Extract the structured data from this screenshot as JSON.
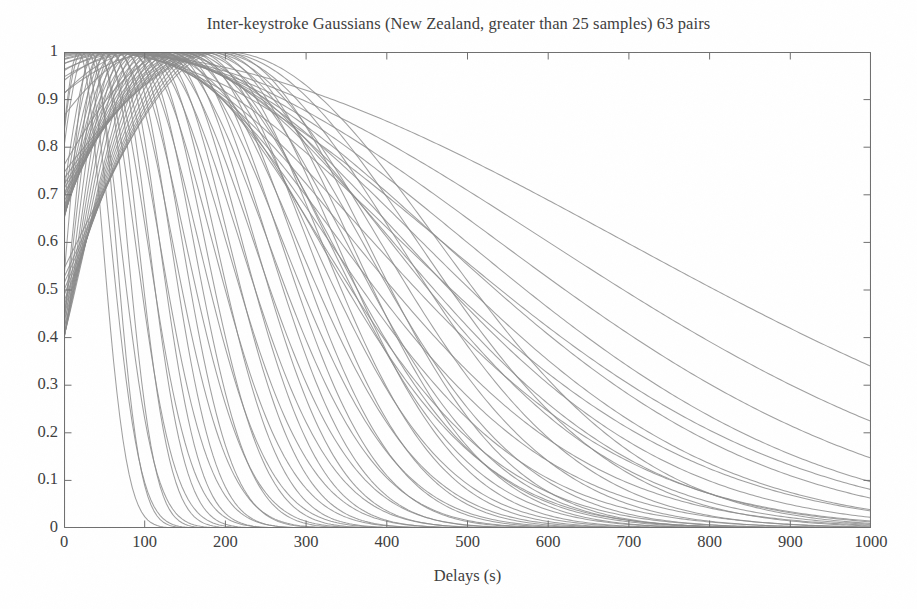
{
  "chart_data": {
    "type": "line",
    "title": "Inter-keystroke Gaussians (New Zealand, greater than 25 samples) 63 pairs",
    "xlabel": "Delays (s)",
    "ylabel": "",
    "xlim": [
      0,
      1000
    ],
    "ylim": [
      0,
      1
    ],
    "grid": false,
    "legend_position": "none",
    "series_count": 63,
    "curve_color": "#8a8a8a",
    "axis_color": "#6f6f6f",
    "background_color": "#ffffff",
    "text_color": "#3d3d3d",
    "x_ticks": [
      0,
      100,
      200,
      300,
      400,
      500,
      600,
      700,
      800,
      900,
      1000
    ],
    "y_ticks": [
      0,
      0.1,
      0.2,
      0.3,
      0.4,
      0.5,
      0.6,
      0.7,
      0.8,
      0.9,
      1
    ],
    "x_tick_labels": [
      "0",
      "100",
      "200",
      "300",
      "400",
      "500",
      "600",
      "700",
      "800",
      "900",
      "1000"
    ],
    "y_tick_labels": [
      "0",
      "0.1",
      "0.2",
      "0.3",
      "0.4",
      "0.5",
      "0.6",
      "0.7",
      "0.8",
      "0.9",
      "1"
    ],
    "series": [
      {
        "name": "pair-1",
        "mu": 18,
        "sigma": 30
      },
      {
        "name": "pair-2",
        "mu": 22,
        "sigma": 36
      },
      {
        "name": "pair-3",
        "mu": 28,
        "sigma": 42
      },
      {
        "name": "pair-4",
        "mu": 34,
        "sigma": 30
      },
      {
        "name": "pair-5",
        "mu": 40,
        "sigma": 48
      },
      {
        "name": "pair-6",
        "mu": 44,
        "sigma": 34
      },
      {
        "name": "pair-7",
        "mu": 48,
        "sigma": 55
      },
      {
        "name": "pair-8",
        "mu": 52,
        "sigma": 40
      },
      {
        "name": "pair-9",
        "mu": 56,
        "sigma": 62
      },
      {
        "name": "pair-10",
        "mu": 60,
        "sigma": 45
      },
      {
        "name": "pair-11",
        "mu": 64,
        "sigma": 70
      },
      {
        "name": "pair-12",
        "mu": 68,
        "sigma": 50
      },
      {
        "name": "pair-13",
        "mu": 72,
        "sigma": 78
      },
      {
        "name": "pair-14",
        "mu": 76,
        "sigma": 56
      },
      {
        "name": "pair-15",
        "mu": 80,
        "sigma": 86
      },
      {
        "name": "pair-16",
        "mu": 84,
        "sigma": 62
      },
      {
        "name": "pair-17",
        "mu": 88,
        "sigma": 95
      },
      {
        "name": "pair-18",
        "mu": 92,
        "sigma": 68
      },
      {
        "name": "pair-19",
        "mu": 96,
        "sigma": 104
      },
      {
        "name": "pair-20",
        "mu": 100,
        "sigma": 74
      },
      {
        "name": "pair-21",
        "mu": 104,
        "sigma": 113
      },
      {
        "name": "pair-22",
        "mu": 108,
        "sigma": 80
      },
      {
        "name": "pair-23",
        "mu": 112,
        "sigma": 122
      },
      {
        "name": "pair-24",
        "mu": 116,
        "sigma": 88
      },
      {
        "name": "pair-25",
        "mu": 120,
        "sigma": 132
      },
      {
        "name": "pair-26",
        "mu": 124,
        "sigma": 96
      },
      {
        "name": "pair-27",
        "mu": 128,
        "sigma": 142
      },
      {
        "name": "pair-28",
        "mu": 132,
        "sigma": 104
      },
      {
        "name": "pair-29",
        "mu": 136,
        "sigma": 152
      },
      {
        "name": "pair-30",
        "mu": 140,
        "sigma": 112
      },
      {
        "name": "pair-31",
        "mu": 144,
        "sigma": 163
      },
      {
        "name": "pair-32",
        "mu": 148,
        "sigma": 120
      },
      {
        "name": "pair-33",
        "mu": 152,
        "sigma": 175
      },
      {
        "name": "pair-34",
        "mu": 156,
        "sigma": 128
      },
      {
        "name": "pair-35",
        "mu": 160,
        "sigma": 188
      },
      {
        "name": "pair-36",
        "mu": 164,
        "sigma": 137
      },
      {
        "name": "pair-37",
        "mu": 168,
        "sigma": 200
      },
      {
        "name": "pair-38",
        "mu": 172,
        "sigma": 146
      },
      {
        "name": "pair-39",
        "mu": 176,
        "sigma": 214
      },
      {
        "name": "pair-40",
        "mu": 180,
        "sigma": 156
      },
      {
        "name": "pair-41",
        "mu": 184,
        "sigma": 228
      },
      {
        "name": "pair-42",
        "mu": 188,
        "sigma": 166
      },
      {
        "name": "pair-43",
        "mu": 192,
        "sigma": 244
      },
      {
        "name": "pair-44",
        "mu": 196,
        "sigma": 178
      },
      {
        "name": "pair-45",
        "mu": 200,
        "sigma": 262
      },
      {
        "name": "pair-46",
        "mu": 140,
        "sigma": 190
      },
      {
        "name": "pair-47",
        "mu": 120,
        "sigma": 282
      },
      {
        "name": "pair-48",
        "mu": 110,
        "sigma": 205
      },
      {
        "name": "pair-49",
        "mu": 100,
        "sigma": 305
      },
      {
        "name": "pair-50",
        "mu": 95,
        "sigma": 222
      },
      {
        "name": "pair-51",
        "mu": 90,
        "sigma": 330
      },
      {
        "name": "pair-52",
        "mu": 85,
        "sigma": 242
      },
      {
        "name": "pair-53",
        "mu": 80,
        "sigma": 360
      },
      {
        "name": "pair-54",
        "mu": 75,
        "sigma": 265
      },
      {
        "name": "pair-55",
        "mu": 70,
        "sigma": 395
      },
      {
        "name": "pair-56",
        "mu": 65,
        "sigma": 292
      },
      {
        "name": "pair-57",
        "mu": 60,
        "sigma": 435
      },
      {
        "name": "pair-58",
        "mu": 55,
        "sigma": 325
      },
      {
        "name": "pair-59",
        "mu": 50,
        "sigma": 485
      },
      {
        "name": "pair-60",
        "mu": 45,
        "sigma": 370
      },
      {
        "name": "pair-61",
        "mu": 40,
        "sigma": 555
      },
      {
        "name": "pair-62",
        "mu": 35,
        "sigma": 430
      },
      {
        "name": "pair-63",
        "mu": 30,
        "sigma": 660
      }
    ]
  }
}
